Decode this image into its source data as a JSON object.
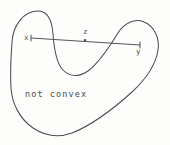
{
  "figure": {
    "caption": "not convex",
    "background_color": "#fdfdfc",
    "stroke_color": "#4e4e52",
    "labels": {
      "x": "x",
      "z": "z",
      "y": "y"
    }
  }
}
